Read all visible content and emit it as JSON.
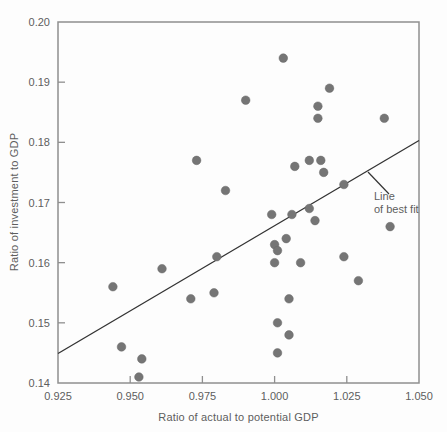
{
  "chart_data": {
    "type": "scatter",
    "title": "",
    "xlabel": "Ratio of actual to potential GDP",
    "ylabel": "Ratio of investment to GDP",
    "xlim": [
      0.925,
      1.05
    ],
    "ylim": [
      0.14,
      0.2
    ],
    "x_ticks": {
      "values": [
        0.925,
        0.95,
        0.975,
        1.0,
        1.025,
        1.05
      ],
      "labels": [
        "0.925",
        "0.950",
        "0.975",
        "1.000",
        "1.025",
        "1.050"
      ]
    },
    "y_ticks": {
      "values": [
        0.14,
        0.15,
        0.16,
        0.17,
        0.18,
        0.19,
        0.2
      ],
      "labels": [
        "0.14",
        "0.15",
        "0.16",
        "0.17",
        "0.18",
        "0.19",
        "0.20"
      ]
    },
    "grid": false,
    "points": [
      [
        0.944,
        0.156
      ],
      [
        0.947,
        0.146
      ],
      [
        0.953,
        0.141
      ],
      [
        0.954,
        0.144
      ],
      [
        0.961,
        0.159
      ],
      [
        0.971,
        0.154
      ],
      [
        0.973,
        0.177
      ],
      [
        0.979,
        0.155
      ],
      [
        0.98,
        0.161
      ],
      [
        0.983,
        0.172
      ],
      [
        0.99,
        0.187
      ],
      [
        0.999,
        0.168
      ],
      [
        1.0,
        0.163
      ],
      [
        1.0,
        0.16
      ],
      [
        1.001,
        0.162
      ],
      [
        1.001,
        0.15
      ],
      [
        1.001,
        0.145
      ],
      [
        1.003,
        0.194
      ],
      [
        1.004,
        0.164
      ],
      [
        1.005,
        0.154
      ],
      [
        1.005,
        0.148
      ],
      [
        1.006,
        0.168
      ],
      [
        1.007,
        0.176
      ],
      [
        1.009,
        0.16
      ],
      [
        1.012,
        0.177
      ],
      [
        1.012,
        0.169
      ],
      [
        1.014,
        0.167
      ],
      [
        1.015,
        0.186
      ],
      [
        1.015,
        0.184
      ],
      [
        1.016,
        0.177
      ],
      [
        1.017,
        0.175
      ],
      [
        1.019,
        0.189
      ],
      [
        1.024,
        0.173
      ],
      [
        1.024,
        0.161
      ],
      [
        1.029,
        0.157
      ],
      [
        1.038,
        0.184
      ],
      [
        1.04,
        0.166
      ]
    ],
    "trend_line": {
      "x1": 0.925,
      "y1": 0.1449,
      "x2": 1.05,
      "y2": 0.1803
    },
    "annotation": {
      "line1": "Line",
      "line2": "of best fit"
    },
    "colors": {
      "point": "#757575",
      "point_edge": "#696969",
      "trend": "#333333",
      "border": "#8f8f8f",
      "text": "#5e5e5e"
    }
  }
}
